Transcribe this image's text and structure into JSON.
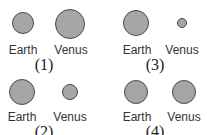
{
  "panels": [
    {
      "number": "(1)",
      "earth": {
        "label": "Earth",
        "cx": 23,
        "cy": 23,
        "r": 11
      },
      "venus": {
        "label": "Venus",
        "cx": 70,
        "cy": 24,
        "r": 15
      },
      "label_y": 44,
      "label_x": [
        23,
        71
      ],
      "num_x": 44,
      "num_y": 57
    },
    {
      "number": "(3)",
      "earth": {
        "label": "Earth",
        "cx": 136,
        "cy": 23,
        "r": 13
      },
      "venus": {
        "label": "Venus",
        "cx": 182,
        "cy": 23,
        "r": 5
      },
      "label_y": 44,
      "label_x": [
        137,
        182
      ],
      "num_x": 155,
      "num_y": 57
    },
    {
      "number": "(2)",
      "earth": {
        "label": "Earth",
        "cx": 22,
        "cy": 92,
        "r": 13
      },
      "venus": {
        "label": "Venus",
        "cx": 70,
        "cy": 92,
        "r": 8
      },
      "label_y": 111,
      "label_x": [
        22,
        70
      ],
      "num_x": 44,
      "num_y": 124
    },
    {
      "number": "(4)",
      "earth": {
        "label": "Earth",
        "cx": 136,
        "cy": 92,
        "r": 12
      },
      "venus": {
        "label": "Venus",
        "cx": 184,
        "cy": 92,
        "r": 12
      },
      "label_y": 111,
      "label_x": [
        137,
        184
      ],
      "num_x": 155,
      "num_y": 124
    }
  ],
  "colors": {
    "fill": "#a6a6a6",
    "stroke": "#4a4a4a",
    "text": "#333333"
  }
}
